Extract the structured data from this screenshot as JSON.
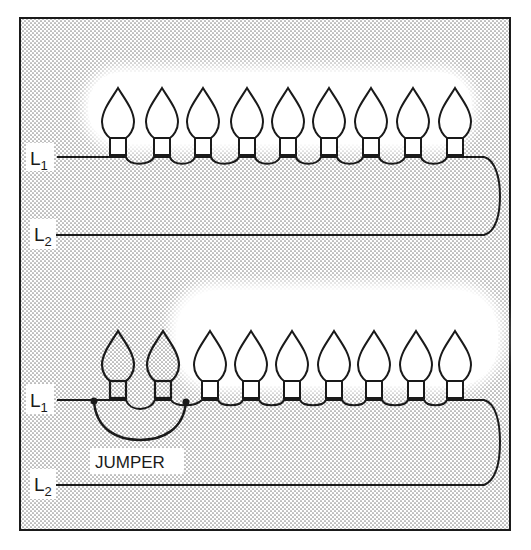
{
  "figure": {
    "colors": {
      "line": "#1a1a1a",
      "stipple": "#8a8a8a",
      "background": "#ffffff"
    },
    "top_diagram": {
      "wire_labels": {
        "l1_main": "L",
        "l1_sub": "1",
        "l2_main": "L",
        "l2_sub": "2"
      },
      "bulb_count": 9
    },
    "bottom_diagram": {
      "wire_labels": {
        "l1_main": "L",
        "l1_sub": "1",
        "l2_main": "L",
        "l2_sub": "2"
      },
      "bulb_count": 9,
      "jumpered_bulbs": 2,
      "jumper_label": "JUMPER"
    }
  }
}
